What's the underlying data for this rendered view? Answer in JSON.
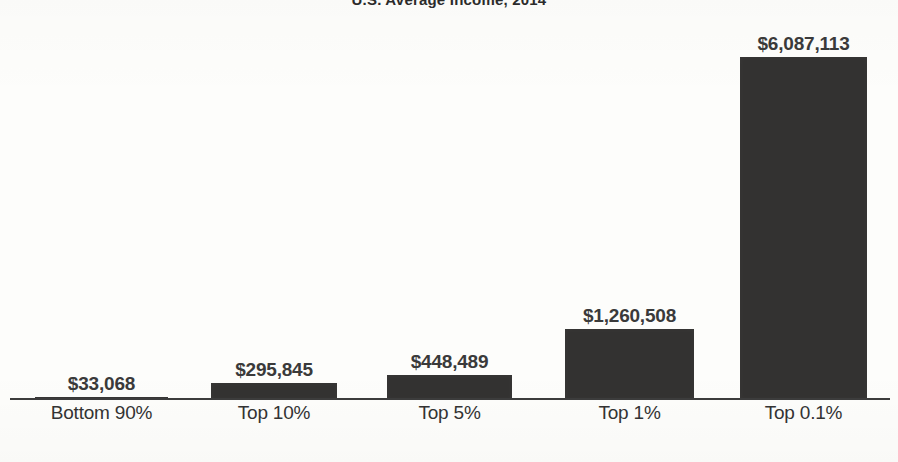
{
  "chart_data": {
    "type": "bar",
    "title": "U.S. Average Income, 2014",
    "xlabel": "",
    "ylabel": "",
    "grid": false,
    "legend": "none",
    "ylim": [
      0,
      6087113
    ],
    "categories": [
      "Bottom 90%",
      "Top 10%",
      "Top 5%",
      "Top 1%",
      "Top 0.1%"
    ],
    "values": [
      33068,
      295845,
      448489,
      1260508,
      6087113
    ],
    "value_labels": [
      "$33,068",
      "$295,845",
      "$448,489",
      "$1,260,508",
      "$6,087,113"
    ],
    "bar_color": "#333231",
    "axis_color": "#3c3c3c",
    "background_color": "#fdfdfb"
  },
  "bars": [
    {
      "label": "Bottom 90%",
      "value_label": "$33,068",
      "left": 35,
      "width": 133,
      "height": 3,
      "label_left": 35,
      "label_width": 133
    },
    {
      "label": "Top 10%",
      "value_label": "$295,845",
      "left": 211,
      "width": 126,
      "height": 17,
      "label_left": 211,
      "label_width": 126
    },
    {
      "label": "Top 5%",
      "value_label": "$448,489",
      "left": 387,
      "width": 125,
      "height": 25,
      "label_left": 387,
      "label_width": 125
    },
    {
      "label": "Top 1%",
      "value_label": "$1,260,508",
      "left": 565,
      "width": 129,
      "height": 71,
      "label_left": 565,
      "label_width": 129
    },
    {
      "label": "Top 0.1%",
      "value_label": "$6,087,113",
      "left": 740,
      "width": 127,
      "height": 343,
      "label_left": 740,
      "label_width": 127
    }
  ]
}
